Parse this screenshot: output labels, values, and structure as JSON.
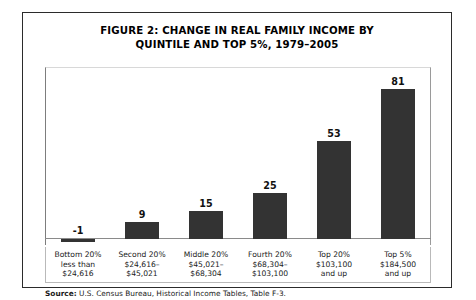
{
  "figure": {
    "title_line1": "FIGURE 2:  CHANGE IN REAL FAMILY INCOME BY",
    "title_line2": "QUINTILE AND TOP 5%, 1979–2005",
    "source_label": "Source:",
    "source_text": " U.S. Census Bureau, Historical Income Tables, Table F-3."
  },
  "chart_data": {
    "type": "bar",
    "title": "FIGURE 2:  CHANGE IN REAL FAMILY INCOME BY QUINTILE AND TOP 5%, 1979–2005",
    "xlabel": "",
    "ylabel": "",
    "ylim": [
      -5,
      90
    ],
    "grid": false,
    "legend": "none",
    "bar_color": "#333333",
    "categories": [
      "Bottom 20% less than $24,616",
      "Second 20% $24,616–$45,021",
      "Middle 20% $45,021–$68,304",
      "Fourth 20% $68,304–$103,100",
      "Top 20% $103,100 and up",
      "Top 5% $184,500 and up"
    ],
    "values": [
      -1,
      9,
      15,
      25,
      53,
      81
    ],
    "value_labels": [
      "-1",
      "9",
      "15",
      "25",
      "53",
      "81"
    ],
    "category_lines": [
      [
        "Bottom 20%",
        "less than",
        "$24,616"
      ],
      [
        "Second 20%",
        "$24,616–",
        "$45,021"
      ],
      [
        "Middle 20%",
        "$45,021–",
        "$68,304"
      ],
      [
        "Fourth 20%",
        "$68,304–",
        "$103,100"
      ],
      [
        "Top 20%",
        "$103,100",
        "and up"
      ],
      [
        "Top 5%",
        "$184,500",
        "and up"
      ]
    ]
  }
}
